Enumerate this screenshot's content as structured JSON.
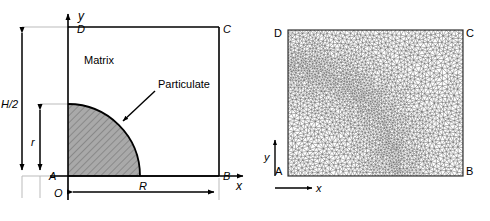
{
  "figure": {
    "panels": [
      {
        "id": "schematic",
        "name": "unit-cell-schematic",
        "labels": {
          "corner_a": "A",
          "corner_b": "B",
          "corner_c": "C",
          "corner_d": "D",
          "origin": "O",
          "axis_x": "x",
          "axis_y": "y",
          "matrix": "Matrix",
          "particulate": "Particulate",
          "dim_half_height": "H/2",
          "dim_radius_vertical": "r",
          "dim_radius_horizontal": "R"
        },
        "colors": {
          "particulate_fill": "#a9a9a9",
          "hatch": "#6e6e6e",
          "outline": "#000000",
          "thin_guide": "#b4b4b4"
        }
      },
      {
        "id": "mesh",
        "name": "finite-element-mesh",
        "labels": {
          "corner_a": "A",
          "corner_b": "B",
          "corner_c": "C",
          "corner_d": "D",
          "axis_x": "x",
          "axis_y": "y"
        },
        "colors": {
          "mesh_line": "#555555",
          "border": "#333333"
        },
        "mesh": {
          "type": "unstructured-triangular",
          "description": "refined quarter-circle interface band",
          "nominal_spacing": 4,
          "refined_spacing": 2.2
        }
      }
    ]
  }
}
